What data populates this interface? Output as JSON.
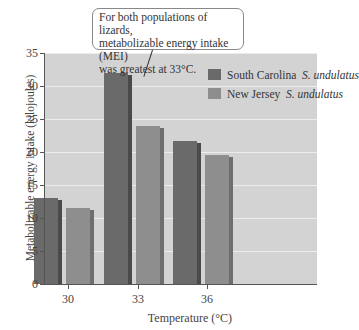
{
  "chart_data": {
    "type": "bar",
    "title": "",
    "xlabel": "Temperature (°C)",
    "ylabel": "Metabolizable energy intake (kilojoules)",
    "categories": [
      "30",
      "33",
      "36"
    ],
    "series": [
      {
        "name": "South Carolina S. undulatus",
        "region": "South Carolina",
        "species": "S. undulatus",
        "color": "#6a6a6a",
        "values": [
          13,
          32,
          21.6
        ]
      },
      {
        "name": "New Jersey S. undulatus",
        "region": "New Jersey",
        "species": "S. undulatus",
        "color": "#8e8e8e",
        "values": [
          11.5,
          24,
          19.5
        ]
      }
    ],
    "ylim": [
      0,
      35
    ],
    "yticks": [
      "0",
      "5",
      "10",
      "15",
      "20",
      "25",
      "30",
      "35"
    ],
    "grid": true,
    "legend_position": "upper right inside",
    "annotation": "For both populations of lizards, metabolizable energy intake (MEI) was greatest at 33°C."
  },
  "callout": {
    "line1": "For both populations of lizards,",
    "line2": "metabolizable energy intake (MEI)",
    "line3": "was greatest at 33°C."
  },
  "legend": [
    {
      "region": "South Carolina",
      "species": "S. undulatus"
    },
    {
      "region": "New Jersey",
      "species": "S. undulatus"
    }
  ]
}
